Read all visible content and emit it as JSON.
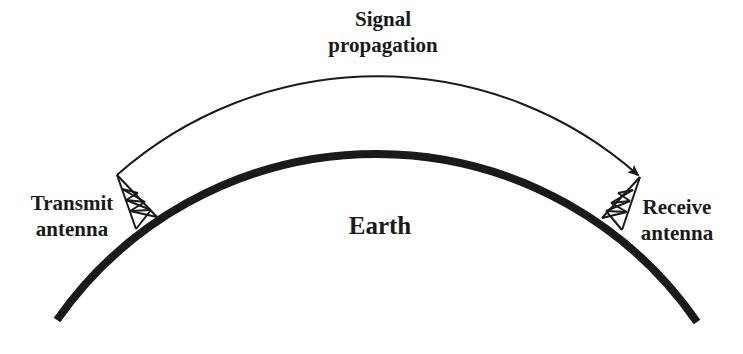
{
  "diagram": {
    "title_line1": "Signal",
    "title_line2": "propagation",
    "earth_label": "Earth",
    "transmit_line1": "Transmit",
    "transmit_line2": "antenna",
    "receive_line1": "Receive",
    "receive_line2": "antenna",
    "colors": {
      "ink": "#1a1a1a",
      "background": "#ffffff"
    }
  }
}
